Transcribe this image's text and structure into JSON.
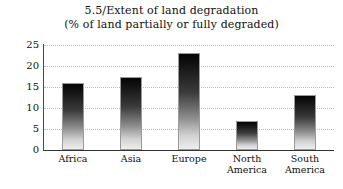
{
  "chart_data": {
    "type": "bar",
    "title": "5.5/Extent of land degradation",
    "subtitle": "(% of land partially or fully degraded)",
    "categories": [
      "Africa",
      "Asia",
      "Europe",
      "North America",
      "South America"
    ],
    "category_lines": [
      [
        "Africa"
      ],
      [
        "Asia"
      ],
      [
        "Europe"
      ],
      [
        "North",
        "America"
      ],
      [
        "South",
        "America"
      ]
    ],
    "values": [
      16,
      17.5,
      23,
      7,
      13
    ],
    "xlabel": "",
    "ylabel": "",
    "ylim": [
      0,
      25
    ],
    "yticks": [
      25,
      20,
      15,
      10,
      5,
      0
    ],
    "grid": true,
    "legend": false,
    "bar_color_top": "#050505",
    "bar_color_bottom": "#eeeeee",
    "bar_outline": "#9a9a9a",
    "axis_color": "#333333",
    "gridline_color": "#b9b9b9"
  }
}
